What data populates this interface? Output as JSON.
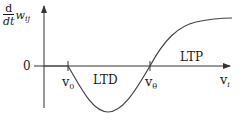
{
  "diagram": {
    "ylabel": {
      "num": "d",
      "den": "dt",
      "var": "w",
      "sub": "ij"
    },
    "zero_label": "0",
    "xlabel": {
      "var": "v",
      "sub": "i"
    },
    "v0": {
      "var": "v",
      "sub": "0"
    },
    "vtheta": {
      "var": "v",
      "sub": "θ"
    },
    "region_ltd": "LTD",
    "region_ltp": "LTP",
    "colors": {
      "line": "#333333",
      "text": "#1a1a1a"
    }
  }
}
